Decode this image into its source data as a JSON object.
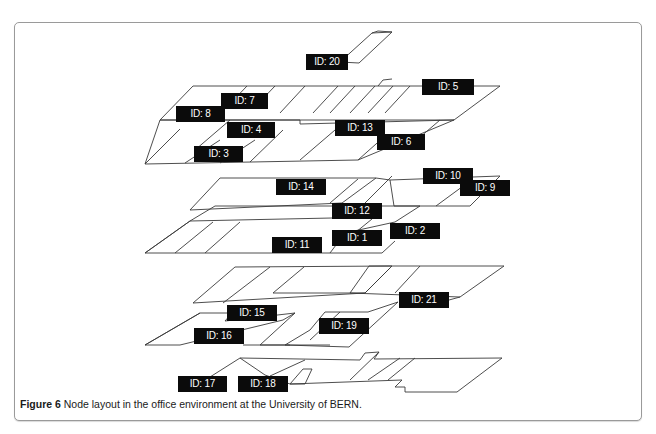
{
  "figure": {
    "label": "Figure 6",
    "caption": "Node layout in the office environment at the University of BERN."
  },
  "nodes": [
    {
      "id": "ID: 20",
      "x": 306,
      "y": 54,
      "w": 42
    },
    {
      "id": "ID: 5",
      "x": 422,
      "y": 79,
      "w": 52
    },
    {
      "id": "ID: 7",
      "x": 221,
      "y": 93,
      "w": 47
    },
    {
      "id": "ID: 8",
      "x": 176,
      "y": 106,
      "w": 49
    },
    {
      "id": "ID: 4",
      "x": 227,
      "y": 122,
      "w": 48
    },
    {
      "id": "ID: 13",
      "x": 335,
      "y": 120,
      "w": 50
    },
    {
      "id": "ID: 6",
      "x": 377,
      "y": 134,
      "w": 48
    },
    {
      "id": "ID: 3",
      "x": 194,
      "y": 146,
      "w": 49
    },
    {
      "id": "ID: 14",
      "x": 276,
      "y": 179,
      "w": 50
    },
    {
      "id": "ID: 10",
      "x": 423,
      "y": 168,
      "w": 50
    },
    {
      "id": "ID: 9",
      "x": 460,
      "y": 180,
      "w": 50
    },
    {
      "id": "ID: 12",
      "x": 332,
      "y": 203,
      "w": 50
    },
    {
      "id": "ID: 2",
      "x": 390,
      "y": 223,
      "w": 50
    },
    {
      "id": "ID: 1",
      "x": 332,
      "y": 230,
      "w": 50
    },
    {
      "id": "ID: 11",
      "x": 272,
      "y": 237,
      "w": 50
    },
    {
      "id": "ID: 21",
      "x": 399,
      "y": 292,
      "w": 50
    },
    {
      "id": "ID: 15",
      "x": 227,
      "y": 305,
      "w": 50
    },
    {
      "id": "ID: 19",
      "x": 319,
      "y": 318,
      "w": 50
    },
    {
      "id": "ID: 16",
      "x": 194,
      "y": 328,
      "w": 50
    },
    {
      "id": "ID: 17",
      "x": 178,
      "y": 376,
      "w": 49
    },
    {
      "id": "ID: 18",
      "x": 238,
      "y": 376,
      "w": 50
    }
  ]
}
